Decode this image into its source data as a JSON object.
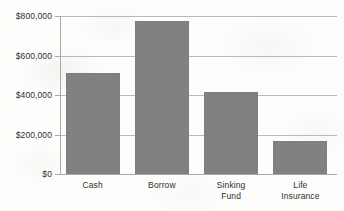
{
  "chart_data": {
    "type": "bar",
    "title": "",
    "subtitle": "",
    "xlabel": "",
    "ylabel": "",
    "categories": [
      "Cash",
      "Borrow",
      "Sinking\nFund",
      "Life\nInsurance"
    ],
    "values": [
      510000,
      775000,
      415000,
      165000
    ],
    "ylim": [
      0,
      800000
    ],
    "y_ticks": [
      0,
      200000,
      400000,
      600000,
      800000
    ],
    "y_tick_labels": [
      "$0",
      "$200,000",
      "$400,000",
      "$600,000",
      "$800,000"
    ],
    "grid": true,
    "grid_axis": "y",
    "legend": false,
    "legend_position": "none",
    "series": [
      {
        "name": "",
        "color": "#818181",
        "values": [
          510000,
          775000,
          415000,
          165000
        ]
      }
    ]
  },
  "colors": {
    "bar_fill": "#818181",
    "gridline": "#b9b9b5",
    "axis_line": "#a8a8a4",
    "text": "#2f2f2f",
    "background": "#fdfdfc"
  }
}
